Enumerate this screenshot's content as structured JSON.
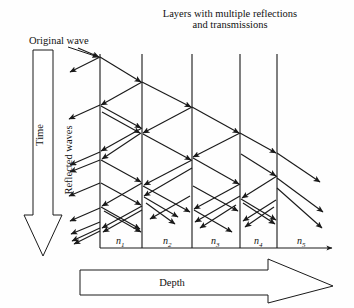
{
  "figure": {
    "type": "ray-diagram",
    "title": "Layers with multiple reflections and transmissions",
    "title_line1": "Layers with multiple reflections",
    "title_line2": "and transmissions",
    "labels": {
      "original_wave": "Original wave",
      "time_axis": "Time",
      "reflected_waves": "Reflected waves",
      "depth_axis": "Depth"
    },
    "layer_labels": [
      {
        "base": "n",
        "sub": "1"
      },
      {
        "base": "n",
        "sub": "2"
      },
      {
        "base": "n",
        "sub": "3"
      },
      {
        "base": "n",
        "sub": "4"
      },
      {
        "base": "n",
        "sub": "5"
      }
    ],
    "interfaces_x": [
      100,
      142,
      192,
      240,
      277
    ],
    "baseline_y": 248,
    "colors": {
      "stroke": "#1a1a1a",
      "interface": "#555555",
      "background": "#ffffff",
      "text": "#111111"
    }
  }
}
